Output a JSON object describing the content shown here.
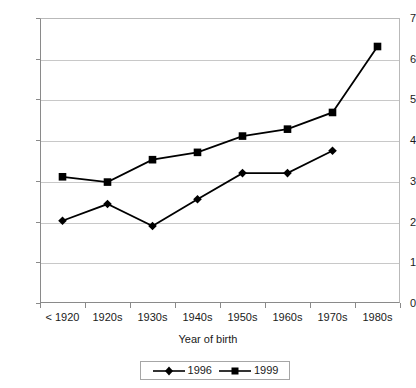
{
  "chart_data": {
    "type": "line",
    "title": "",
    "xlabel": "Year of birth",
    "ylabel": "",
    "categories": [
      "< 1920",
      "1920s",
      "1930s",
      "1940s",
      "1950s",
      "1960s",
      "1970s",
      "1980s"
    ],
    "series": [
      {
        "name": "1996",
        "marker": "diamond",
        "color": "#000000",
        "values": [
          2.02,
          2.43,
          1.89,
          2.55,
          3.19,
          3.19,
          3.74,
          null
        ]
      },
      {
        "name": "1999",
        "marker": "square",
        "color": "#000000",
        "values": [
          3.1,
          2.97,
          3.52,
          3.7,
          4.1,
          4.27,
          4.68,
          6.3
        ]
      }
    ],
    "ylim": [
      0,
      7
    ],
    "yticks": [
      0,
      1,
      2,
      3,
      4,
      5,
      6,
      7
    ],
    "ytick_labels": [
      "0",
      "1",
      "2",
      "3",
      "4",
      "5",
      "6",
      "7"
    ],
    "grid": "horizontal",
    "legend_position": "bottom-center",
    "legend_entries": [
      "1996",
      "1999"
    ],
    "axis_color": "#8a8a8a",
    "grid_color": "#c8c8c8",
    "plot_background": "#ffffff"
  }
}
